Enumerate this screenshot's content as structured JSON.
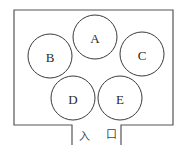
{
  "diagram": {
    "type": "floor-plan",
    "colors": {
      "wall": "#555555",
      "booth_stroke": "#3a3a3a",
      "text": "#2a2a2a",
      "background": "#ffffff"
    },
    "booths": [
      {
        "id": "A",
        "label": "A",
        "cx": 95,
        "cy": 37,
        "r": 22
      },
      {
        "id": "B",
        "label": "B",
        "cx": 50,
        "cy": 56,
        "r": 22
      },
      {
        "id": "C",
        "label": "C",
        "cx": 142,
        "cy": 54,
        "r": 22
      },
      {
        "id": "D",
        "label": "D",
        "cx": 73,
        "cy": 98,
        "r": 22
      },
      {
        "id": "E",
        "label": "E",
        "cx": 120,
        "cy": 98,
        "r": 22
      }
    ],
    "entrance": {
      "label_char_1": "入",
      "label_char_2": "口"
    }
  }
}
